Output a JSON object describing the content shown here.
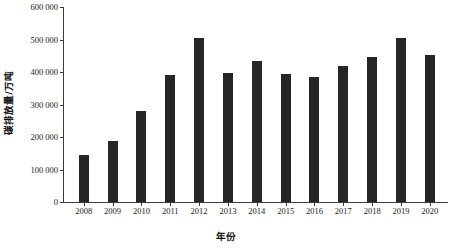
{
  "chart_data": {
    "type": "bar",
    "title": "",
    "xlabel": "年份",
    "ylabel": "碳排放量/万吨",
    "categories": [
      "2008",
      "2009",
      "2010",
      "2011",
      "2012",
      "2013",
      "2014",
      "2015",
      "2016",
      "2017",
      "2018",
      "2019",
      "2020"
    ],
    "values": [
      146000,
      188000,
      281000,
      391000,
      506000,
      396000,
      435000,
      395000,
      385000,
      420000,
      447000,
      505000,
      452000
    ],
    "ylim": [
      0,
      600000
    ],
    "yticks": [
      0,
      100000,
      200000,
      300000,
      400000,
      500000,
      600000
    ],
    "ytick_labels": [
      "0",
      "100 000",
      "200 000",
      "300 000",
      "400 000",
      "500 000",
      "600 000"
    ],
    "grid": false,
    "legend": null,
    "bar_color": "#262626",
    "axis_color": "#3a3a3a"
  }
}
